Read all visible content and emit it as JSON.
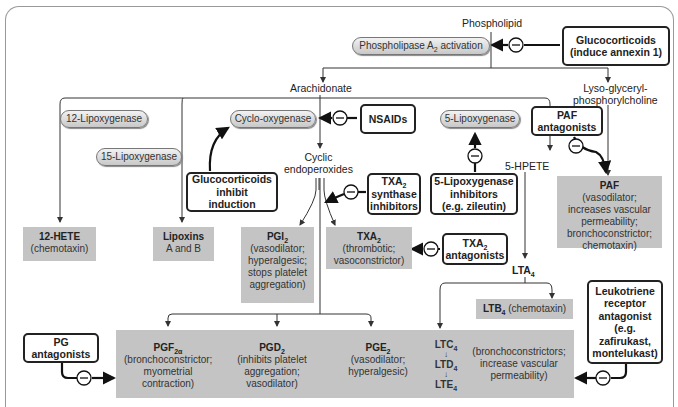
{
  "diagram": {
    "top": {
      "phospholipid": "Phospholipid",
      "pla2": "Phospholipase A",
      "pla2_sub": "2",
      "pla2_tail": " activation",
      "gluco_annexin_line1": "Glucocorticoids",
      "gluco_annexin_line2": "(induce annexin 1)",
      "arachidonate": "Arachidonate",
      "lyso_line1": "Lyso-glyceryl-",
      "lyso_line2": "phosphorylcholine"
    },
    "enzymes": {
      "lox12": "12-Lipoxygenase",
      "lox15": "15-Lipoxygenase",
      "cox": "Cyclo-oxygenase",
      "lox5": "5-Lipoxygenase"
    },
    "inhibitors": {
      "nsaids": "NSAIDs",
      "gluco_induction": [
        "Glucocorticoids",
        "inhibit",
        "induction"
      ],
      "txa2_synth": [
        "TXA",
        "synthase",
        "inhibitors"
      ],
      "lox5_inhib": [
        "5-Lipoxygenase",
        "inhibitors",
        "(e.g. zileutin)"
      ],
      "paf_antag": [
        "PAF",
        "antagonists"
      ],
      "txa2_antag": [
        "TXA",
        "antagonists"
      ],
      "pg_antag": [
        "PG",
        "antagonists"
      ],
      "lt_antag": [
        "Leukotriene",
        "receptor",
        "antagonist",
        "(e.g.",
        "zafirukast,",
        "montelukast)"
      ],
      "minus_symbol": "−"
    },
    "intermediates": {
      "cyclic_endo": [
        "Cyclic",
        "endoperoxides"
      ],
      "hpete5": "5-HPETE",
      "lta4": "LTA",
      "lta4_sub": "4"
    },
    "products": {
      "hete12": {
        "name": "12-HETE",
        "desc": "(chemotaxin)"
      },
      "lipoxins": {
        "name": "Lipoxins",
        "desc": "A and B"
      },
      "pgi2": {
        "name": "PGI",
        "sub": "2",
        "desc": [
          "(vasodilator;",
          "hyperalgesic;",
          "stops platelet",
          "aggregation)"
        ]
      },
      "txa2": {
        "name": "TXA",
        "sub": "2",
        "desc": [
          "(thrombotic;",
          "vasoconstrictor)"
        ]
      },
      "paf": {
        "name": "PAF",
        "desc": [
          "(vasodilator;",
          "increases vascular",
          "permeability;",
          "bronchoconstrictor;",
          "chemotaxin)"
        ]
      },
      "ltb4": {
        "name": "LTB",
        "sub": "4",
        "desc": " (chemotaxin)"
      },
      "pgf2a": {
        "name": "PGF",
        "sub": "2α",
        "desc": [
          "(bronchoconstrictor;",
          "myometrial",
          "contraction)"
        ]
      },
      "pgd2": {
        "name": "PGD",
        "sub": "2",
        "desc": [
          "(inhibits platelet",
          "aggregation;",
          "vasodilator)"
        ]
      },
      "pge2": {
        "name": "PGE",
        "sub": "2",
        "desc": [
          "(vasodilator;",
          "hyperalgesic)"
        ]
      },
      "cysteinyl_lt": {
        "ltc4": "LTC",
        "ltd4": "LTD",
        "lte4": "LTE",
        "sub": "4",
        "desc": [
          "(bronchoconstrictors;",
          "increase vascular",
          "permeability)"
        ]
      }
    },
    "colors": {
      "product_fill": "#c4c4c4",
      "box_border": "#222222",
      "frame": "#999999"
    }
  }
}
